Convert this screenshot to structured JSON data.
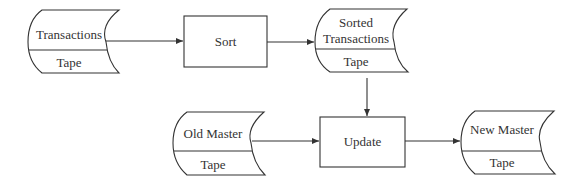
{
  "diagram": {
    "type": "system flowchart",
    "line_color": "#333333",
    "nodes": [
      {
        "id": "transactions",
        "shape": "tape",
        "label": "Transactions",
        "sublabel": "Tape"
      },
      {
        "id": "sort",
        "shape": "process",
        "label": "Sort"
      },
      {
        "id": "sorted",
        "shape": "tape",
        "label_line1": "Sorted",
        "label_line2": "Transactions",
        "sublabel": "Tape"
      },
      {
        "id": "old_master",
        "shape": "tape",
        "label": "Old Master",
        "sublabel": "Tape"
      },
      {
        "id": "update",
        "shape": "process",
        "label": "Update"
      },
      {
        "id": "new_master",
        "shape": "tape",
        "label": "New Master",
        "sublabel": "Tape"
      }
    ],
    "edges": [
      {
        "from": "transactions",
        "to": "sort"
      },
      {
        "from": "sort",
        "to": "sorted"
      },
      {
        "from": "sorted",
        "to": "update"
      },
      {
        "from": "old_master",
        "to": "update"
      },
      {
        "from": "update",
        "to": "new_master"
      }
    ]
  }
}
